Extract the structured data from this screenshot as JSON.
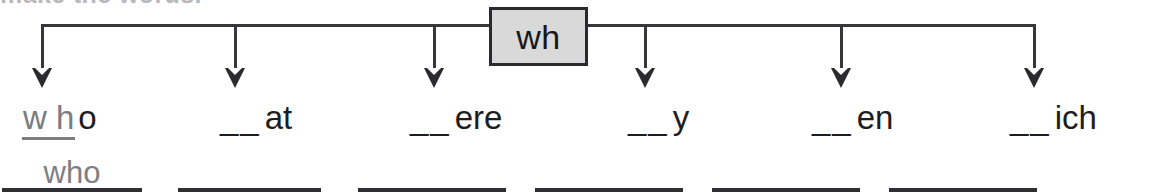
{
  "worksheet": {
    "clipped_heading": "make the words.",
    "root": {
      "label": "wh",
      "box_fill": "#d9d9d9",
      "box_border": "#2b2b2f"
    },
    "branch_count": 6,
    "ink_color": "#2f2f33",
    "handwriting_color": "#7e7e83",
    "items": [
      {
        "blanks": "",
        "filled": "w h",
        "rest": "o",
        "answer": "who",
        "arrow_x": 41,
        "word_x": 22,
        "line_x": 2,
        "line_w": 140
      },
      {
        "blanks": "__",
        "filled": "",
        "rest": "at",
        "answer": "",
        "arrow_x": 234,
        "word_x": 220,
        "line_x": 178,
        "line_w": 143
      },
      {
        "blanks": "__",
        "filled": "",
        "rest": "ere",
        "answer": "",
        "arrow_x": 433,
        "word_x": 410,
        "line_x": 358,
        "line_w": 148
      },
      {
        "blanks": "__",
        "filled": "",
        "rest": "y",
        "answer": "",
        "arrow_x": 644,
        "word_x": 628,
        "line_x": 535,
        "line_w": 148
      },
      {
        "blanks": "__",
        "filled": "",
        "rest": "en",
        "answer": "",
        "arrow_x": 840,
        "word_x": 812,
        "line_x": 712,
        "line_w": 148
      },
      {
        "blanks": "__",
        "filled": "",
        "rest": "ich",
        "answer": "",
        "arrow_x": 1033,
        "word_x": 1010,
        "line_x": 889,
        "line_w": 148
      }
    ],
    "geometry": {
      "bar_y": 24,
      "bar_left": 41,
      "bar_right": 1034,
      "box_left": 489,
      "box_right": 588,
      "arrow_tip_y": 88
    }
  }
}
